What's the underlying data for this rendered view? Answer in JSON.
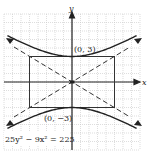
{
  "diagram": {
    "type": "hyperbola-graph",
    "equation": "25y² − 9x² = 225",
    "axes": {
      "x_label": "x",
      "y_label": "y"
    },
    "vertices": [
      {
        "label": "(0, 3)",
        "x": 0,
        "y": 3
      },
      {
        "label": "(0, −3)",
        "x": 0,
        "y": -3
      }
    ],
    "parameters": {
      "a": 3,
      "b": 5
    },
    "fundamental_rectangle": {
      "x_min": -5,
      "x_max": 5,
      "y_min": -3,
      "y_max": 3
    },
    "asymptotes": [
      "y = 3/5 x",
      "y = -3/5 x"
    ],
    "grid": {
      "x_range": [
        -8,
        8
      ],
      "y_range": [
        -8,
        8
      ],
      "step": 1
    },
    "colors": {
      "curve": "#333333",
      "grid": "#bdbdbd",
      "axis": "#222222"
    }
  }
}
